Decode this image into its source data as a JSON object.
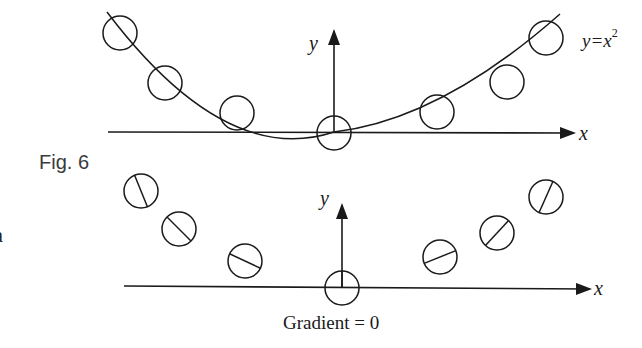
{
  "figure": {
    "caption": "Fig. 6",
    "left_margin_glyph": "a"
  },
  "top_diagram": {
    "x_axis_label": "x",
    "y_axis_label": "y",
    "curve_label_prefix": "y=x",
    "curve_label_exponent": "2",
    "curve_equation": "y=x²",
    "circles": [
      {
        "cx": 120,
        "cy": 33
      },
      {
        "cx": 165,
        "cy": 83
      },
      {
        "cx": 237,
        "cy": 113
      },
      {
        "cx": 334,
        "cy": 133
      },
      {
        "cx": 437,
        "cy": 112
      },
      {
        "cx": 507,
        "cy": 82
      },
      {
        "cx": 546,
        "cy": 38
      }
    ]
  },
  "bottom_diagram": {
    "x_axis_label": "x",
    "y_axis_label": "y",
    "annotation": "Gradient = 0",
    "annotation_lhs": "Gradient",
    "annotation_rhs": "0",
    "circles": [
      {
        "cx": 141,
        "cy": 191,
        "line_angle_deg": 68
      },
      {
        "cx": 179,
        "cy": 229,
        "line_angle_deg": 45
      },
      {
        "cx": 245,
        "cy": 261,
        "line_angle_deg": 25
      },
      {
        "cx": 342,
        "cy": 288,
        "line_angle_deg": 90
      },
      {
        "cx": 440,
        "cy": 257,
        "line_angle_deg": -22
      },
      {
        "cx": 497,
        "cy": 233,
        "line_angle_deg": -47
      },
      {
        "cx": 546,
        "cy": 197,
        "line_angle_deg": -66
      }
    ]
  },
  "colors": {
    "ink": "#1a1a1a",
    "caption": "#3a3a3a",
    "background": "#ffffff"
  }
}
